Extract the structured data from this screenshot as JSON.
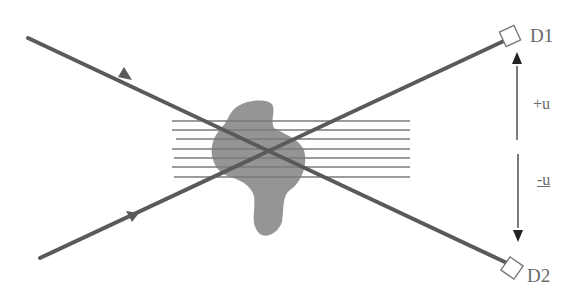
{
  "diagram": {
    "detectors": [
      {
        "id": "D1",
        "label": "D1"
      },
      {
        "id": "D2",
        "label": "D2"
      }
    ],
    "velocity_labels": {
      "plus": "+u",
      "minus": "-u"
    },
    "colors": {
      "beam": "#5a5a5a",
      "blob": "#8f8f8f",
      "field_lines": "#7a7a7a",
      "arrow": "#222222",
      "detector_outline": "#777777",
      "text": "#6a6a6a"
    },
    "elements": {
      "beams": 2,
      "field_lines": 7,
      "velocity_arrows": 2
    }
  }
}
